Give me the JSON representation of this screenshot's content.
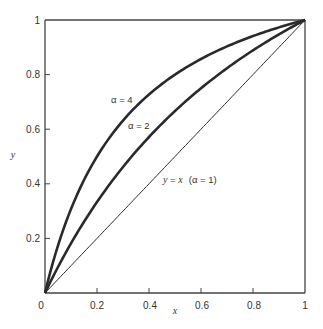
{
  "chart_data": {
    "type": "line",
    "title": "",
    "xlabel": "x",
    "ylabel": "y",
    "xlim": [
      0,
      1
    ],
    "ylim": [
      0,
      1
    ],
    "grid": false,
    "legend": "none (inline curve annotations)",
    "x_ticks": [
      "0",
      "0.2",
      "0.4",
      "0.6",
      "0.8",
      "1"
    ],
    "y_ticks": [
      "0.2",
      "0.4",
      "0.6",
      "0.8",
      "1"
    ],
    "x": [
      0,
      0.1,
      0.2,
      0.3,
      0.4,
      0.5,
      0.6,
      0.7,
      0.8,
      0.9,
      1.0
    ],
    "series": [
      {
        "name": "α = 4",
        "alpha": 4,
        "formula": "y = αx / (1 + (α − 1)x)",
        "line_weight": "thick",
        "values": [
          0,
          0.308,
          0.5,
          0.632,
          0.727,
          0.8,
          0.857,
          0.903,
          0.941,
          0.973,
          1.0
        ]
      },
      {
        "name": "α = 2",
        "alpha": 2,
        "formula": "y = αx / (1 + (α − 1)x)",
        "line_weight": "thick",
        "values": [
          0,
          0.182,
          0.333,
          0.462,
          0.571,
          0.667,
          0.75,
          0.824,
          0.889,
          0.947,
          1.0
        ]
      },
      {
        "name": "y = x (α = 1)",
        "alpha": 1,
        "formula": "y = x",
        "line_weight": "thin",
        "values": [
          0,
          0.1,
          0.2,
          0.3,
          0.4,
          0.5,
          0.6,
          0.7,
          0.8,
          0.9,
          1.0
        ]
      }
    ],
    "annotations": [
      {
        "text": "α = 4",
        "near": [
          0.3,
          0.72
        ]
      },
      {
        "text": "α = 2",
        "near": [
          0.38,
          0.64
        ]
      },
      {
        "text": "y = x  (α = 1)",
        "near": [
          0.6,
          0.46
        ]
      }
    ]
  },
  "labels": {
    "x_axis": "x",
    "y_axis": "y",
    "origin": "0",
    "x_ticks": [
      "0.2",
      "0.4",
      "0.6",
      "0.8",
      "1"
    ],
    "y_ticks": [
      "0.2",
      "0.4",
      "0.6",
      "0.8",
      "1"
    ],
    "alpha4": "α = 4",
    "alpha2": "α = 2",
    "diag_y": "y",
    "diag_eq": " = ",
    "diag_x": "x",
    "diag_alpha": "(α = 1)"
  }
}
